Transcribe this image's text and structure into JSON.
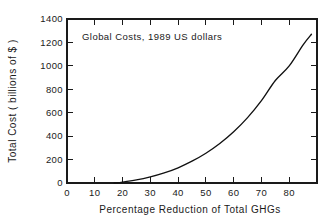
{
  "chart_data": {
    "type": "line",
    "title": "",
    "annotation": "Global Costs, 1989 US dollars",
    "xlabel": "Percentage Reduction of Total GHGs",
    "ylabel": "Total Cost ( billions of $ )",
    "xlim": [
      0,
      90
    ],
    "ylim": [
      0,
      1400
    ],
    "grid": false,
    "legend": "none",
    "xticks": [
      0,
      10,
      20,
      30,
      40,
      50,
      60,
      70,
      80
    ],
    "xtick_labels": [
      "0",
      "10",
      "20",
      "30",
      "40",
      "50",
      "60",
      "70",
      "80"
    ],
    "yticks": [
      0,
      200,
      400,
      600,
      800,
      1000,
      1200,
      1400
    ],
    "ytick_labels": [
      "0",
      "200",
      "400",
      "600",
      "800",
      "1000",
      "1200",
      "1400"
    ],
    "series": [
      {
        "name": "Total Cost",
        "x": [
          17,
          20,
          25,
          30,
          35,
          40,
          45,
          50,
          55,
          60,
          65,
          70,
          75,
          80,
          85,
          88
        ],
        "values": [
          0,
          8,
          26,
          52,
          86,
          130,
          186,
          254,
          337,
          437,
          558,
          703,
          875,
          1000,
          1180,
          1270
        ]
      }
    ]
  },
  "figure": {
    "background_color": "#ffffff",
    "line_color": "#111111",
    "axis_color": "#1a1a1a"
  }
}
